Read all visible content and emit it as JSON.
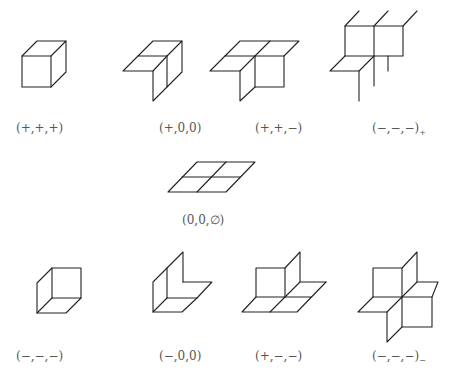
{
  "figures": [
    {
      "id": "fig1",
      "label": "(+,+,+)",
      "sub": ""
    },
    {
      "id": "fig2",
      "label": "(+,0,0)",
      "sub": ""
    },
    {
      "id": "fig3",
      "label": "(+,+,−)",
      "sub": ""
    },
    {
      "id": "fig4",
      "label": "(−,−,−)",
      "sub": "+"
    },
    {
      "id": "fig5",
      "label": "(0,0,∅)",
      "sub": ""
    },
    {
      "id": "fig6",
      "label": "(−,−,−)",
      "sub": ""
    },
    {
      "id": "fig7",
      "label": "(−,0,0)",
      "sub": ""
    },
    {
      "id": "fig8",
      "label": "(+,−,−)",
      "sub": ""
    },
    {
      "id": "fig9",
      "label": "(−,−,−)",
      "sub": "−"
    }
  ],
  "colors": {
    "stroke": "#222222",
    "label": "#555555",
    "background": "#ffffff"
  }
}
